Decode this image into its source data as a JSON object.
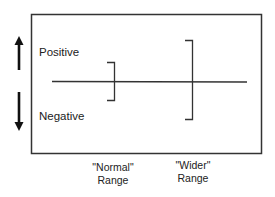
{
  "diagram": {
    "type": "range-comparison",
    "labels": {
      "positive": "Positive",
      "negative": "Negative"
    },
    "ranges": [
      {
        "name": "normal",
        "quote_label": "\"Normal\"",
        "sub_label": "Range"
      },
      {
        "name": "wider",
        "quote_label": "\"Wider\"",
        "sub_label": "Range"
      }
    ],
    "arrows": {
      "up": "up-arrow",
      "down": "down-arrow"
    },
    "colors": {
      "line": "#333333",
      "arrow": "#111111",
      "background": "#ffffff"
    }
  }
}
